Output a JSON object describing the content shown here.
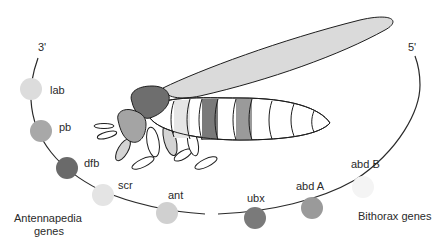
{
  "diagram": {
    "ends": {
      "three_prime": "3'",
      "five_prime": "5'"
    },
    "groups": {
      "antennapedia": [
        "Antennapedia",
        "genes"
      ],
      "bithorax": "Bithorax genes"
    },
    "genes": [
      {
        "name": "lab",
        "color": "#dcdcdc",
        "group": "Antennapedia"
      },
      {
        "name": "pb",
        "color": "#a8a8a8",
        "group": "Antennapedia"
      },
      {
        "name": "dfb",
        "color": "#6a6a6a",
        "group": "Antennapedia"
      },
      {
        "name": "scr",
        "color": "#e4e4e4",
        "group": "Antennapedia"
      },
      {
        "name": "ant",
        "color": "#d0d0d0",
        "group": "Antennapedia"
      },
      {
        "name": "ubx",
        "color": "#7a7a7a",
        "group": "Bithorax"
      },
      {
        "name": "abd A",
        "color": "#9a9a9a",
        "group": "Bithorax"
      },
      {
        "name": "abd B",
        "color": "#f4f4f4",
        "group": "Bithorax"
      }
    ],
    "fly_colors": {
      "wing": "#dadada",
      "thorax": "#6e6e6e",
      "head": "#a4a4a4",
      "outline": "#1e1e1e"
    }
  }
}
